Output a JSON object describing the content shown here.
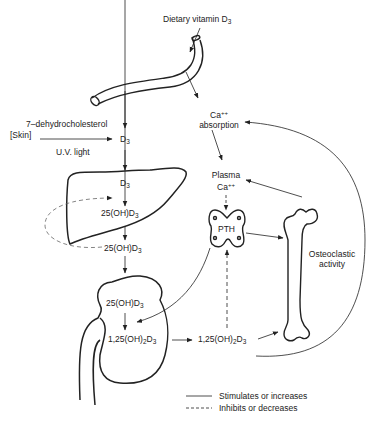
{
  "labels": {
    "dietary": {
      "main": "Dietary vitamin D",
      "sub": "3"
    },
    "dehydro": "7–dehydrocholesterol",
    "skin": "[Skin]",
    "uv": "U.V. light",
    "d3_skin": {
      "main": "D",
      "sub": "3"
    },
    "d3_liver": {
      "main": "D",
      "sub": "3"
    },
    "oh25_liver": {
      "main": "25(OH)D",
      "sub": "3"
    },
    "oh25_blood": {
      "main": "25(OH)D",
      "sub": "3"
    },
    "oh25_kidney": {
      "main": "25(OH)D",
      "sub": "3"
    },
    "dihydroxy_kidney": {
      "pre": "1,25(OH)",
      "sub1": "2",
      "mid": "D",
      "sub2": "3"
    },
    "dihydroxy_blood": {
      "pre": "1,25(OH)",
      "sub1": "2",
      "mid": "D",
      "sub2": "3"
    },
    "ca_absorption": {
      "ion": "Ca",
      "charge": "++",
      "line2": "absorption"
    },
    "plasma_ca": {
      "line1": "Plasma",
      "ion": "Ca",
      "charge": "++"
    },
    "pth": "PTH",
    "osteoclastic": {
      "line1": "Osteoclastic",
      "line2": "activity"
    }
  },
  "legend": {
    "solid": "Stimulates or increases",
    "dashed": "Inhibits or decreases"
  },
  "colors": {
    "stroke": "#222222",
    "background": "#ffffff",
    "dashed": "#666666"
  }
}
